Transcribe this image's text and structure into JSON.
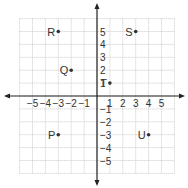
{
  "chart_data": {
    "type": "scatter",
    "title": "",
    "xlabel": "",
    "ylabel": "",
    "xlim": [
      -6,
      6
    ],
    "ylim": [
      -6,
      6
    ],
    "grid": true,
    "x_ticks": [
      -5,
      -4,
      -3,
      -2,
      -1,
      1,
      2,
      3,
      4,
      5
    ],
    "y_ticks": [
      5,
      4,
      3,
      2,
      1,
      -1,
      -2,
      -3,
      -4,
      -5
    ],
    "x_tick_labels": [
      "−5",
      "−4",
      "−3",
      "−2",
      "−1",
      "1",
      "2",
      "3",
      "4",
      "5"
    ],
    "y_tick_labels": [
      "5",
      "4",
      "3",
      "2",
      "1",
      "−1",
      "−2",
      "−3",
      "−4",
      "−5"
    ],
    "points": [
      {
        "label": "R",
        "x": -3,
        "y": 5
      },
      {
        "label": "S",
        "x": 3,
        "y": 5
      },
      {
        "label": "Q",
        "x": -2,
        "y": 2
      },
      {
        "label": "T",
        "x": 1,
        "y": 1
      },
      {
        "label": "P",
        "x": -3,
        "y": -3
      },
      {
        "label": "U",
        "x": 4,
        "y": -3
      }
    ]
  },
  "colors": {
    "grid": "#c8c8c8",
    "axis": "#222222",
    "point": "#333333",
    "text": "#333333"
  }
}
